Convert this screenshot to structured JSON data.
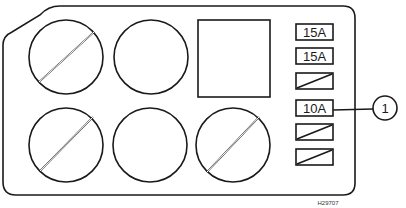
{
  "diagram": {
    "relays": [
      {
        "row": 1,
        "col": 1,
        "state": "slashed"
      },
      {
        "row": 1,
        "col": 2,
        "state": "empty"
      },
      {
        "row": 2,
        "col": 1,
        "state": "slashed"
      },
      {
        "row": 2,
        "col": 2,
        "state": "empty"
      },
      {
        "row": 2,
        "col": 3,
        "state": "slashed"
      }
    ],
    "square_component": {
      "state": "empty"
    },
    "fuses": [
      {
        "label": "15A",
        "state": "rated"
      },
      {
        "label": "15A",
        "state": "rated"
      },
      {
        "label": "",
        "state": "slashed"
      },
      {
        "label": "10A",
        "state": "rated"
      },
      {
        "label": "",
        "state": "slashed"
      },
      {
        "label": "",
        "state": "slashed"
      }
    ],
    "callout": {
      "number": "1",
      "points_to_fuse_index": 3
    },
    "reference_code": "H29707"
  }
}
